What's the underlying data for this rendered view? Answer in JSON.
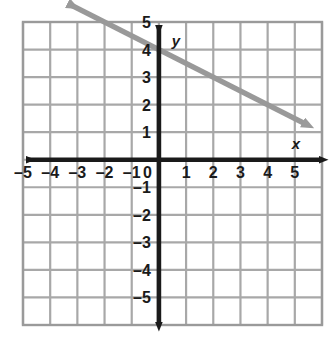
{
  "figure": {
    "background_color": "#ffffff"
  },
  "grid": {
    "color": "#a8a8a8",
    "border_color": "#9a9a9a",
    "cell_size_px": 27.2,
    "columns": 11,
    "rows": 11,
    "left_px": 23,
    "top_px": 22,
    "right_px": 322,
    "bottom_px": 325,
    "show": true
  },
  "axes": {
    "color": "#1a1a1a",
    "x_label": "x",
    "y_label": "y",
    "origin_label": "0",
    "x_min": -5,
    "x_max": 5,
    "y_min": -5,
    "y_max": 5,
    "x_ticks": [
      -5,
      -4,
      -3,
      -2,
      -1,
      1,
      2,
      3,
      4,
      5
    ],
    "y_ticks": [
      5,
      4,
      3,
      2,
      1,
      -1,
      -2,
      -3,
      -4,
      -5
    ],
    "x_tick_labels": [
      "–5",
      "–4",
      "–3",
      "–2",
      "–1",
      "1",
      "2",
      "3",
      "4",
      "5"
    ],
    "y_tick_labels": [
      "5",
      "4",
      "3",
      "2",
      "1",
      "–1",
      "–2",
      "–3",
      "–4",
      "–5"
    ],
    "arrowheads": [
      "left",
      "right",
      "up",
      "down"
    ]
  },
  "chart_data": {
    "type": "line",
    "title": "",
    "xlabel": "x",
    "ylabel": "y",
    "xlim": [
      -5.5,
      5.5
    ],
    "ylim": [
      -5.5,
      5.5
    ],
    "grid": true,
    "legend": "none",
    "series": [
      {
        "name": "line",
        "color": "#999999",
        "slope": -0.5,
        "y_intercept": 4,
        "equation": "y = -1/2 x + 4",
        "x_intercept": 8,
        "style": "solid",
        "arrows": "both",
        "drawn_from": {
          "x": -3.3,
          "y": 5.65
        },
        "drawn_to": {
          "x": 5.35,
          "y": 1.32
        },
        "points": [
          {
            "x": -2,
            "y": 5
          },
          {
            "x": 0,
            "y": 4
          },
          {
            "x": 2,
            "y": 3
          },
          {
            "x": 4,
            "y": 2
          }
        ]
      }
    ]
  }
}
